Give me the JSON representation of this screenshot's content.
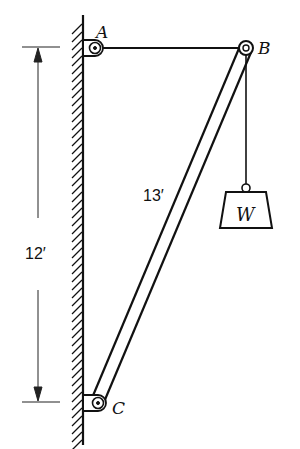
{
  "diagram": {
    "type": "statics-truss",
    "points": {
      "A": {
        "label": "A",
        "x": 95,
        "y": 48
      },
      "B": {
        "label": "B",
        "x": 246,
        "y": 48
      },
      "C": {
        "label": "C",
        "x": 98,
        "y": 403
      }
    },
    "members": [
      {
        "name": "cable-AB",
        "from": "A",
        "to": "B",
        "style": "single-line"
      },
      {
        "name": "strut-BC",
        "from": "B",
        "to": "C",
        "style": "double-line",
        "length_label": "13′"
      },
      {
        "name": "hanger-B-W",
        "from": "B",
        "to": "W",
        "style": "single-line"
      }
    ],
    "load": {
      "label": "W",
      "shape": "trapezoid-weight"
    },
    "supports": [
      {
        "at": "A",
        "type": "pin-on-wall"
      },
      {
        "at": "C",
        "type": "pin-on-wall"
      }
    ],
    "wall": {
      "side": "left",
      "hatched": true
    },
    "dimensions": [
      {
        "name": "height",
        "label": "12′",
        "from": "A",
        "to": "C"
      }
    ],
    "colors": {
      "ink": "#111111",
      "background": "#ffffff"
    }
  }
}
